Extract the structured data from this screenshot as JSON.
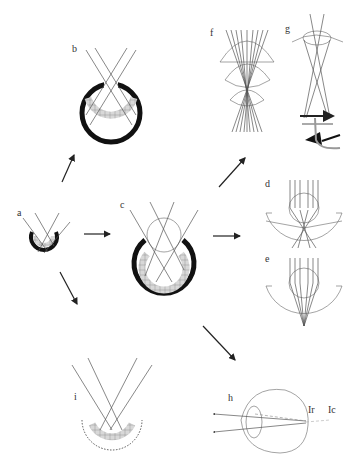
{
  "figure": {
    "type": "multi-panel scientific diagram",
    "panels": [
      {
        "id": "a",
        "label": "a",
        "description": "shallow cup eye with small pigment cup and photoreceptors"
      },
      {
        "id": "b",
        "label": "b",
        "description": "pinhole eye - deep pigmented cup with narrow aperture"
      },
      {
        "id": "c",
        "label": "c",
        "description": "cup eye with spherical lens"
      },
      {
        "id": "d",
        "label": "d",
        "description": "lens eye with spherical lens, rays converging before retina"
      },
      {
        "id": "e",
        "label": "e",
        "description": "lens eye with graded-index lens focusing on retina"
      },
      {
        "id": "f",
        "label": "f",
        "description": "multiple lens layers focusing parallel rays"
      },
      {
        "id": "g",
        "label": "g",
        "description": "eye with cornea, lens and retina forming inverted image"
      },
      {
        "id": "h",
        "label": "h",
        "description": "reflecting eye with tapetum; Ir and Ic labels",
        "sublabels": [
          "Ir",
          "Ic"
        ]
      },
      {
        "id": "i",
        "label": "i",
        "description": "concave mirror eye with reflective back surface"
      }
    ],
    "arrows": [
      {
        "from": "a",
        "to": "b"
      },
      {
        "from": "a",
        "to": "c"
      },
      {
        "from": "a",
        "to": "i"
      },
      {
        "from": "c",
        "to": "f"
      },
      {
        "from": "c",
        "to": "d"
      },
      {
        "from": "c",
        "to": "h"
      }
    ],
    "colors": {
      "background": "#ffffff",
      "pigment": "#111111",
      "receptors": "#cccccc",
      "lines": "#555555"
    }
  }
}
